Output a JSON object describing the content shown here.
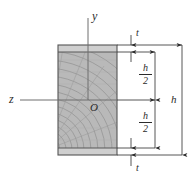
{
  "figure": {
    "type": "engineering-cross-section",
    "colors": {
      "web_fill": "#b9b9b9",
      "flange_fill": "#cfcfcf",
      "outline": "#555555",
      "grain": "#8f8f8f",
      "axis": "#6e6e6e",
      "dimension": "#2b2b2b",
      "background": "#ffffff"
    }
  },
  "axes": {
    "vertical_label": "y",
    "horizontal_label": "z",
    "origin_label": "O"
  },
  "dimensions": {
    "top_thickness": "t",
    "bottom_thickness": "t",
    "upper_half": {
      "numerator": "h",
      "denominator": "2"
    },
    "lower_half": {
      "numerator": "h",
      "denominator": "2"
    },
    "total_height": "h"
  },
  "geometry": {
    "section_left": 58,
    "section_right": 117,
    "section_top": 45,
    "section_bottom": 155,
    "flange_top_y1": 45,
    "flange_top_y2": 52,
    "flange_bottom_y1": 148,
    "flange_bottom_y2": 155,
    "origin_x": 88,
    "origin_y": 100
  }
}
